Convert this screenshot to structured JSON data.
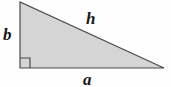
{
  "figure": {
    "type": "right-triangle-diagram",
    "background_color": "#fefefe",
    "fill_color": "#d5d5d5",
    "stroke_color": "#4a4a4a",
    "label_color": "#171717",
    "vertices": {
      "top_left": [
        20,
        2
      ],
      "bottom_left": [
        20,
        68
      ],
      "bottom_right": [
        164,
        68
      ]
    },
    "right_angle_marker": {
      "name": "right-angle-square",
      "corner": [
        20,
        68
      ],
      "size": 10
    },
    "labels": {
      "vertical_leg": "b",
      "horizontal_leg": "a",
      "hypotenuse": "h"
    }
  }
}
